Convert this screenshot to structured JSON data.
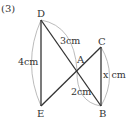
{
  "problem_number": "(3)",
  "points": {
    "A": {
      "label": "A",
      "x": 77,
      "y": 70
    },
    "B": {
      "label": "B",
      "x": 101,
      "y": 106
    },
    "C": {
      "label": "C",
      "x": 101,
      "y": 47
    },
    "D": {
      "label": "D",
      "x": 41,
      "y": 20
    },
    "E": {
      "label": "E",
      "x": 41,
      "y": 106
    }
  },
  "measurements": {
    "DE": "4cm",
    "DA": "3cm",
    "AB": "2cm",
    "CB": "x cm"
  },
  "colors": {
    "line": "#333333",
    "arc": "#999999",
    "background": "#ffffff"
  }
}
